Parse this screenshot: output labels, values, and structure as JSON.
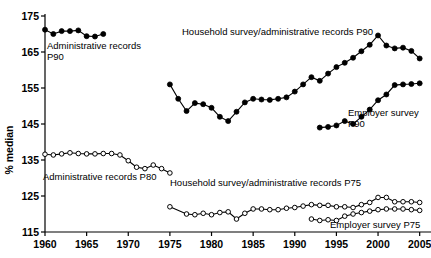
{
  "chart_data": {
    "type": "line",
    "title": "",
    "xlabel": "",
    "ylabel": "% median",
    "xlim": [
      1960,
      2006
    ],
    "ylim": [
      115,
      175
    ],
    "xticks": [
      1960,
      1965,
      1970,
      1975,
      1980,
      1985,
      1990,
      1995,
      2000,
      2005
    ],
    "yticks": [
      115,
      125,
      135,
      145,
      155,
      165,
      175
    ],
    "xtick_labels": [
      "1960",
      "1965",
      "1970",
      "1975",
      "1980",
      "1985",
      "1990",
      "1995",
      "2000",
      "2005"
    ],
    "ytick_labels": [
      "115",
      "125",
      "135",
      "145",
      "155",
      "165",
      "175"
    ],
    "grid": false,
    "legend": "annotations-inline",
    "series": [
      {
        "name": "Administrative records P90",
        "marker": "filled-circle",
        "label": "Administrative records\nP90",
        "label_line1": "Administrative records",
        "label_line2": "P90",
        "x": [
          1960,
          1961,
          1962,
          1963,
          1964,
          1965,
          1966,
          1967
        ],
        "values": [
          171.2,
          170.0,
          170.8,
          170.8,
          171.0,
          169.4,
          169.3,
          170.0
        ]
      },
      {
        "name": "Household survey/administrative records P90",
        "marker": "filled-circle",
        "label": "Household survey/administrative records P90",
        "x": [
          1975,
          1976,
          1977,
          1978,
          1979,
          1980,
          1981,
          1982,
          1983,
          1984,
          1985,
          1986,
          1987,
          1988,
          1989,
          1990,
          1991,
          1992,
          1993,
          1994,
          1995,
          1996,
          1997,
          1998,
          1999,
          2000,
          2001,
          2002,
          2003,
          2004,
          2005
        ],
        "values": [
          156.0,
          152.0,
          148.6,
          150.8,
          150.5,
          149.5,
          147.0,
          145.8,
          148.4,
          151.0,
          152.0,
          151.8,
          151.7,
          152.0,
          152.4,
          154.0,
          156.0,
          158.0,
          157.0,
          159.0,
          160.8,
          162.0,
          163.4,
          165.2,
          167.0,
          169.6,
          166.8,
          166.0,
          166.2,
          165.3,
          163.2
        ]
      },
      {
        "name": "Employer survey P90",
        "marker": "filled-circle",
        "label": "Employer survey\nP90",
        "label_line1": "Employer survey",
        "label_line2": "P90",
        "x": [
          1993,
          1994,
          1995,
          1996,
          1997,
          1998,
          1999,
          2000,
          2001,
          2002,
          2003,
          2004,
          2005
        ],
        "values": [
          144.0,
          144.2,
          144.6,
          145.8,
          145.0,
          147.0,
          149.0,
          151.6,
          153.2,
          155.8,
          156.0,
          156.1,
          156.3
        ]
      },
      {
        "name": "Administrative records P80",
        "marker": "open-circle",
        "label": "Administrative records P80",
        "x": [
          1960,
          1961,
          1962,
          1963,
          1964,
          1965,
          1966,
          1967,
          1968,
          1969,
          1970,
          1971,
          1972,
          1973,
          1974,
          1975
        ],
        "values": [
          136.6,
          136.4,
          136.7,
          137.0,
          136.8,
          136.7,
          136.7,
          136.8,
          136.8,
          136.4,
          134.8,
          133.0,
          132.6,
          133.6,
          132.6,
          131.4
        ]
      },
      {
        "name": "Household survey/administrative records P75",
        "marker": "open-circle",
        "label": "Household survey/administrative records P75",
        "x": [
          1975,
          1977,
          1978,
          1979,
          1980,
          1981,
          1982,
          1983,
          1984,
          1985,
          1986,
          1987,
          1988,
          1989,
          1990,
          1991,
          1992,
          1993,
          1994,
          1995,
          1996,
          1997,
          1998,
          1999,
          2000,
          2001,
          2002,
          2003,
          2004,
          2005
        ],
        "values": [
          122.0,
          120.0,
          119.8,
          120.2,
          119.8,
          120.4,
          120.6,
          118.6,
          120.2,
          121.4,
          121.4,
          121.2,
          121.2,
          121.6,
          121.8,
          122.2,
          122.6,
          122.4,
          122.4,
          122.0,
          122.0,
          121.8,
          122.6,
          123.2,
          124.6,
          124.6,
          123.4,
          123.4,
          123.4,
          123.2
        ]
      },
      {
        "name": "Employer survey P75",
        "marker": "open-circle",
        "label": "Employer survey P75",
        "x": [
          1992,
          1993,
          1994,
          1995,
          1996,
          1997,
          1998,
          1999,
          2000,
          2001,
          2002,
          2003,
          2004,
          2005
        ],
        "values": [
          118.6,
          118.2,
          118.4,
          118.2,
          119.4,
          120.0,
          120.4,
          120.8,
          121.2,
          121.4,
          121.4,
          121.4,
          121.2,
          121.0
        ]
      }
    ],
    "annotations": [
      {
        "name": "annotation-admin-p90",
        "text_line1": "Administrative records",
        "text_line2": "P90",
        "x": 47,
        "y": 49
      },
      {
        "name": "annotation-household-p90",
        "text_line1": "Household survey/administrative records P90",
        "text_line2": "",
        "x": 182,
        "y": 35
      },
      {
        "name": "annotation-employer-p90",
        "text_line1": "Employer survey",
        "text_line2": "P90",
        "x": 348,
        "y": 116
      },
      {
        "name": "annotation-admin-p80",
        "text_line1": "Administrative records P80",
        "text_line2": "",
        "x": 43,
        "y": 180
      },
      {
        "name": "annotation-household-p75",
        "text_line1": "Household survey/administrative records P75",
        "text_line2": "",
        "x": 170,
        "y": 186
      },
      {
        "name": "annotation-employer-p75",
        "text_line1": "Employer survey P75",
        "text_line2": "",
        "x": 330,
        "y": 228
      }
    ]
  },
  "axis": {
    "y_title": "% median"
  }
}
